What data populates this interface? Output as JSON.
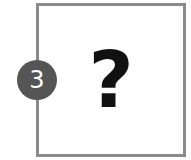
{
  "card": {
    "symbol": "?"
  },
  "badge": {
    "number": "3",
    "color": "#555555"
  }
}
